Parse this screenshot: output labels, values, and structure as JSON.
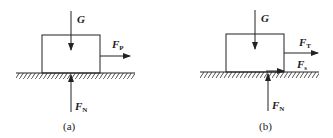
{
  "diagrams": [
    {
      "id": "a",
      "caption": "(a)",
      "forces": {
        "gravity": {
          "symbol": "G",
          "sub": ""
        },
        "pull": {
          "symbol": "F",
          "sub": "P"
        },
        "normal": {
          "symbol": "F",
          "sub": "N"
        }
      }
    },
    {
      "id": "b",
      "caption": "(b)",
      "forces": {
        "gravity": {
          "symbol": "G",
          "sub": ""
        },
        "pull": {
          "symbol": "F",
          "sub": "T"
        },
        "friction": {
          "symbol": "F",
          "sub": "s"
        },
        "normal": {
          "symbol": "F",
          "sub": "N"
        }
      }
    }
  ],
  "colors": {
    "line": "#222222",
    "background": "#ffffff"
  }
}
